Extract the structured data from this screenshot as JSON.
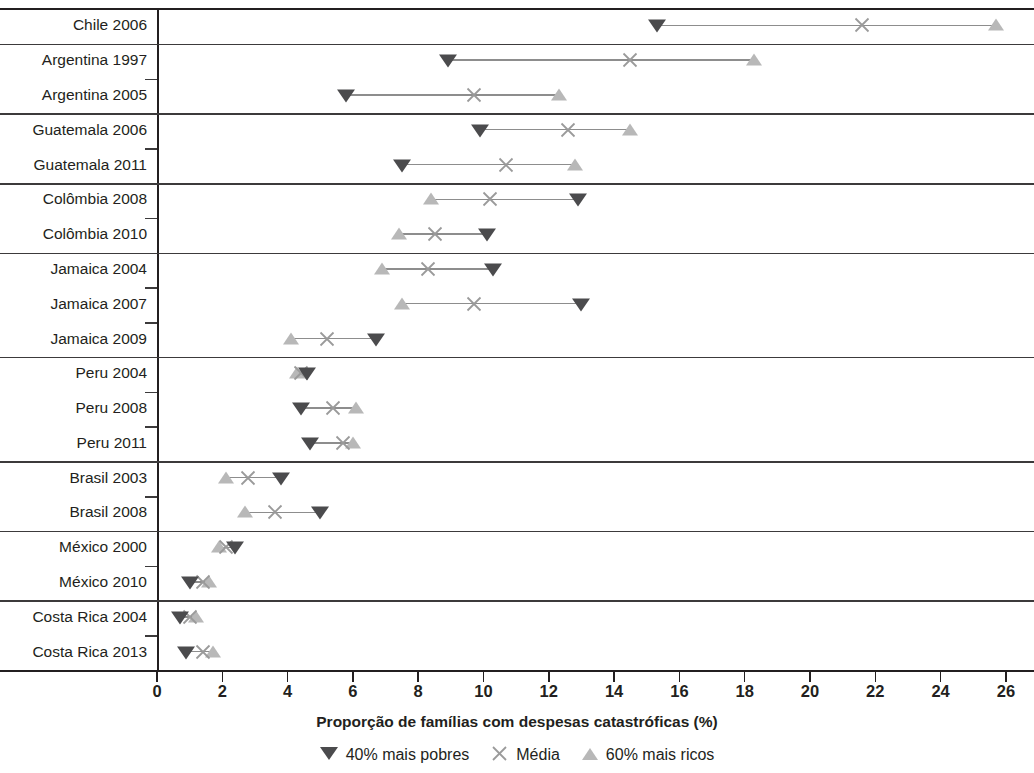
{
  "chart_data": {
    "type": "scatter",
    "title": "",
    "xlabel": "Proporção de famílias com despesas catastróficas (%)",
    "ylabel": "",
    "xlim": [
      0,
      27
    ],
    "xticks": [
      0,
      2,
      4,
      6,
      8,
      10,
      12,
      14,
      16,
      18,
      20,
      22,
      24,
      26
    ],
    "xticklabels": [
      "0",
      "2",
      "4",
      "6",
      "8",
      "10",
      "12",
      "14",
      "16",
      "18",
      "20",
      "22",
      "24",
      "26"
    ],
    "grid": false,
    "legend_position": "bottom",
    "legend": [
      {
        "name": "40% mais pobres",
        "marker": "down-triangle",
        "color": "#4b4b4d"
      },
      {
        "name": "Média",
        "marker": "x-cross",
        "color": "#9a9a9a"
      },
      {
        "name": "60% mais ricos",
        "marker": "up-triangle",
        "color": "#b8b8b8"
      }
    ],
    "series": [
      {
        "name": "40% mais pobres",
        "key": "poor"
      },
      {
        "name": "Média",
        "key": "mean"
      },
      {
        "name": "60% mais ricos",
        "key": "rich"
      }
    ],
    "groups": [
      {
        "country": "Chile",
        "rows": [
          {
            "label": "Chile 2006",
            "poor": 15.3,
            "mean": 21.6,
            "rich": 25.7
          }
        ]
      },
      {
        "country": "Argentina",
        "rows": [
          {
            "label": "Argentina 1997",
            "poor": 8.9,
            "mean": 14.5,
            "rich": 18.3
          },
          {
            "label": "Argentina 2005",
            "poor": 5.8,
            "mean": 9.7,
            "rich": 12.3
          }
        ]
      },
      {
        "country": "Guatemala",
        "rows": [
          {
            "label": "Guatemala 2006",
            "poor": 9.9,
            "mean": 12.6,
            "rich": 14.5
          },
          {
            "label": "Guatemala 2011",
            "poor": 7.5,
            "mean": 10.7,
            "rich": 12.8
          }
        ]
      },
      {
        "country": "Colômbia",
        "rows": [
          {
            "label": "Colômbia 2008",
            "poor": 12.9,
            "mean": 10.2,
            "rich": 8.4
          },
          {
            "label": "Colômbia 2010",
            "poor": 10.1,
            "mean": 8.5,
            "rich": 7.4
          }
        ]
      },
      {
        "country": "Jamaica",
        "rows": [
          {
            "label": "Jamaica 2004",
            "poor": 10.3,
            "mean": 8.3,
            "rich": 6.9
          },
          {
            "label": "Jamaica 2007",
            "poor": 13.0,
            "mean": 9.7,
            "rich": 7.5
          },
          {
            "label": "Jamaica 2009",
            "poor": 6.7,
            "mean": 5.2,
            "rich": 4.1
          }
        ]
      },
      {
        "country": "Peru",
        "rows": [
          {
            "label": "Peru 2004",
            "poor": 4.6,
            "mean": 4.4,
            "rich": 4.3
          },
          {
            "label": "Peru 2008",
            "poor": 4.4,
            "mean": 5.4,
            "rich": 6.1
          },
          {
            "label": "Peru 2011",
            "poor": 4.7,
            "mean": 5.7,
            "rich": 6.0
          }
        ]
      },
      {
        "country": "Brasil",
        "rows": [
          {
            "label": "Brasil 2003",
            "poor": 3.8,
            "mean": 2.8,
            "rich": 2.1
          },
          {
            "label": "Brasil 2008",
            "poor": 5.0,
            "mean": 3.6,
            "rich": 2.7
          }
        ]
      },
      {
        "country": "México",
        "rows": [
          {
            "label": "México 2000",
            "poor": 2.4,
            "mean": 2.1,
            "rich": 1.9
          },
          {
            "label": "México 2010",
            "poor": 1.0,
            "mean": 1.4,
            "rich": 1.6
          }
        ]
      },
      {
        "country": "Costa Rica",
        "rows": [
          {
            "label": "Costa Rica 2004",
            "poor": 0.7,
            "mean": 1.0,
            "rich": 1.2
          },
          {
            "label": "Costa Rica 2013",
            "poor": 0.9,
            "mean": 1.4,
            "rich": 1.7
          }
        ]
      }
    ]
  }
}
